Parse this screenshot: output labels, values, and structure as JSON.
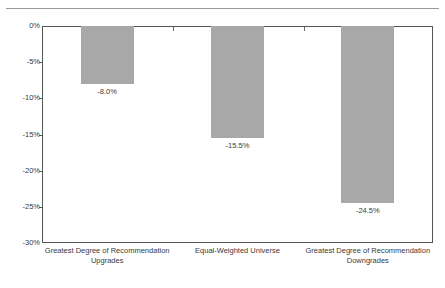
{
  "chart_data": {
    "type": "bar",
    "title": "",
    "subtitle": "",
    "xlabel": "",
    "ylabel": "",
    "ylim": [
      -30,
      0
    ],
    "grid": false,
    "legend": "none",
    "orientation": "vertical",
    "bar_color": "#a8a8a8",
    "categories": [
      "Greatest Degree of Recommendation Upgrades",
      "Equal-Weighted Universe",
      "Greatest Degree of Recommendation Downgrades"
    ],
    "category_lines": [
      [
        "Greatest Degree of Recommendation",
        "Upgrades"
      ],
      [
        "Equal-Weighted Universe",
        ""
      ],
      [
        "Greatest Degree of Recommendation",
        "Downgrades"
      ]
    ],
    "values": [
      -8.0,
      -15.5,
      -24.5
    ],
    "data_labels": [
      "-8.0%",
      "-15.5%",
      "-24.5%"
    ],
    "ytick_values": [
      0,
      -5,
      -10,
      -15,
      -20,
      -25,
      -30
    ],
    "ytick_labels": [
      "0%",
      "-5%",
      "-10%",
      "-15%",
      "-20%",
      "-25%",
      "-30%"
    ]
  }
}
